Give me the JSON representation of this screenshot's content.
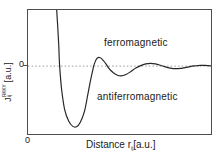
{
  "figure": {
    "background": "#ffffff",
    "frame_color": "#4d4d4d",
    "line_color": "#262626",
    "zero_line_color": "#999999",
    "labels": {
      "ferromagnetic": "ferromagnetic",
      "antiferromagnetic": "antiferromagnetic",
      "y_axis_symbol": "J",
      "y_axis_sup": "RKKY",
      "y_axis_sub": "ij",
      "y_axis_units": "[a.u.]",
      "x_axis_prefix": "Distance r",
      "x_axis_sub": "ij",
      "x_axis_units": "[a.u.]",
      "y_zero": "0",
      "x_origin": "0"
    }
  },
  "chart_data": {
    "type": "line",
    "title": "",
    "xlabel": "Distance r_ij [a.u.]",
    "ylabel": "J_ij^RKKY [a.u.]",
    "x_range": [
      0,
      10
    ],
    "ylim": [
      -1.21,
      1.0
    ],
    "grid": false,
    "legend": "none",
    "zero_line": {
      "value": 0,
      "style": "dotted",
      "label": "0"
    },
    "x_ticks": [
      {
        "value": 0,
        "label": "0"
      }
    ],
    "y_ticks": [
      {
        "value": 0,
        "label": "0"
      }
    ],
    "annotations": [
      {
        "text": "ferromagnetic",
        "region": "J > 0"
      },
      {
        "text": "antiferromagnetic",
        "region": "J < 0"
      }
    ],
    "series": [
      {
        "name": "J_RKKY(r)",
        "points": [
          [
            1.57,
            1.0
          ],
          [
            1.62,
            0.72
          ],
          [
            1.68,
            0.37
          ],
          [
            1.73,
            0.0
          ],
          [
            1.84,
            -0.42
          ],
          [
            2.0,
            -0.77
          ],
          [
            2.22,
            -0.98
          ],
          [
            2.43,
            -1.07
          ],
          [
            2.65,
            -1.08
          ],
          [
            2.86,
            -1.0
          ],
          [
            3.08,
            -0.81
          ],
          [
            3.24,
            -0.56
          ],
          [
            3.4,
            -0.28
          ],
          [
            3.54,
            -0.07
          ],
          [
            3.62,
            0.035
          ],
          [
            3.78,
            0.14
          ],
          [
            3.95,
            0.15
          ],
          [
            4.1,
            0.105
          ],
          [
            4.27,
            0.035
          ],
          [
            4.43,
            -0.044
          ],
          [
            4.65,
            -0.114
          ],
          [
            4.86,
            -0.158
          ],
          [
            5.08,
            -0.175
          ],
          [
            5.35,
            -0.149
          ],
          [
            5.62,
            -0.096
          ],
          [
            5.89,
            -0.035
          ],
          [
            6.16,
            0.009
          ],
          [
            6.43,
            0.039
          ],
          [
            6.7,
            0.049
          ],
          [
            6.97,
            0.039
          ],
          [
            7.24,
            0.014
          ],
          [
            7.51,
            -0.014
          ],
          [
            7.78,
            -0.035
          ],
          [
            8.05,
            -0.046
          ],
          [
            8.32,
            -0.042
          ],
          [
            8.59,
            -0.026
          ],
          [
            8.86,
            -0.009
          ],
          [
            9.14,
            0.004
          ],
          [
            9.4,
            0.012
          ],
          [
            9.68,
            0.012
          ],
          [
            10.0,
            0.004
          ]
        ]
      }
    ]
  }
}
